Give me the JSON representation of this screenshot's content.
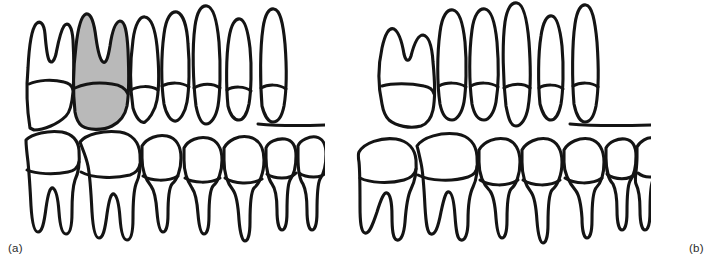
{
  "figure": {
    "background_color": "#ffffff",
    "outline_color": "#141414",
    "shade_color": "#b9b9b9"
  },
  "panels": [
    {
      "id": "a",
      "label": "(a)",
      "caption": "Normal alignment with the upper first molar highlighted",
      "highlighted_tooth": "upper-first-molar",
      "highlight_fill": "#b9b9b9",
      "upper_teeth_count": 7,
      "lower_teeth_count": 7,
      "upper_teeth": [
        {
          "name": "upper-second-molar",
          "type": "molar",
          "roots": 2,
          "shaded": false
        },
        {
          "name": "upper-first-molar",
          "type": "molar",
          "roots": 2,
          "shaded": true
        },
        {
          "name": "upper-second-premolar",
          "type": "premolar",
          "roots": 1,
          "shaded": false
        },
        {
          "name": "upper-first-premolar",
          "type": "premolar",
          "roots": 1,
          "shaded": false
        },
        {
          "name": "upper-canine",
          "type": "canine",
          "roots": 1,
          "shaded": false
        },
        {
          "name": "upper-lateral-incisor",
          "type": "incisor",
          "roots": 1,
          "shaded": false
        },
        {
          "name": "upper-central-incisor",
          "type": "incisor",
          "roots": 1,
          "shaded": false
        }
      ],
      "lower_teeth": [
        {
          "name": "lower-second-molar",
          "type": "molar",
          "roots": 2,
          "shaded": false
        },
        {
          "name": "lower-first-molar",
          "type": "molar",
          "roots": 2,
          "shaded": false
        },
        {
          "name": "lower-second-premolar",
          "type": "premolar",
          "roots": 1,
          "shaded": false
        },
        {
          "name": "lower-first-premolar",
          "type": "premolar",
          "roots": 1,
          "shaded": false
        },
        {
          "name": "lower-canine",
          "type": "canine",
          "roots": 1,
          "shaded": false
        },
        {
          "name": "lower-lateral-incisor",
          "type": "incisor",
          "roots": 1,
          "shaded": false
        },
        {
          "name": "lower-central-incisor",
          "type": "incisor",
          "roots": 1,
          "shaded": false
        }
      ]
    },
    {
      "id": "b",
      "label": "(b)",
      "caption": "After loss of the lower first molar: tilting of adjacent teeth and over-eruption of the opposing upper molar",
      "highlighted_tooth": null,
      "upper_teeth_count": 6,
      "lower_teeth_count": 7,
      "upper_teeth": [
        {
          "name": "upper-second-molar-overerupted",
          "type": "molar",
          "roots": 2,
          "shaded": false,
          "tilted": true
        },
        {
          "name": "upper-second-premolar",
          "type": "premolar",
          "roots": 1,
          "shaded": false
        },
        {
          "name": "upper-first-premolar",
          "type": "premolar",
          "roots": 1,
          "shaded": false
        },
        {
          "name": "upper-canine",
          "type": "canine",
          "roots": 1,
          "shaded": false
        },
        {
          "name": "upper-lateral-incisor",
          "type": "incisor",
          "roots": 1,
          "shaded": false
        },
        {
          "name": "upper-central-incisor",
          "type": "incisor",
          "roots": 1,
          "shaded": false
        }
      ],
      "lower_teeth": [
        {
          "name": "lower-second-molar-tilted",
          "type": "molar",
          "roots": 2,
          "shaded": false,
          "tilted": true
        },
        {
          "name": "lower-first-molar-tilted",
          "type": "molar",
          "roots": 2,
          "shaded": false,
          "tilted": true
        },
        {
          "name": "lower-second-premolar",
          "type": "premolar",
          "roots": 1,
          "shaded": false
        },
        {
          "name": "lower-first-premolar",
          "type": "premolar",
          "roots": 1,
          "shaded": false
        },
        {
          "name": "lower-canine",
          "type": "canine",
          "roots": 1,
          "shaded": false
        },
        {
          "name": "lower-lateral-incisor",
          "type": "incisor",
          "roots": 1,
          "shaded": false
        },
        {
          "name": "lower-central-incisor",
          "type": "incisor",
          "roots": 1,
          "shaded": false
        }
      ]
    }
  ]
}
